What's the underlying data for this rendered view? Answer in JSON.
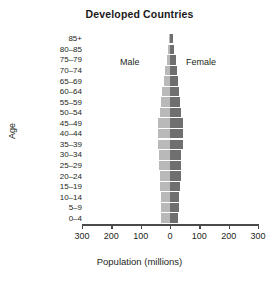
{
  "chart_data": {
    "type": "bar",
    "subtype": "population-pyramid",
    "title": "Developed Countries",
    "xlabel": "Population (millions)",
    "ylabel": "Age",
    "xlim": [
      -300,
      300
    ],
    "xticks": [
      -300,
      -200,
      -100,
      0,
      100,
      200,
      300
    ],
    "xticklabels": [
      "300",
      "200",
      "100",
      "0",
      "100",
      "200",
      "300"
    ],
    "grid": false,
    "legend_position": "inside-top",
    "categories": [
      "85+",
      "80–85",
      "75–79",
      "70–74",
      "65–69",
      "60–64",
      "55–59",
      "50–54",
      "45–49",
      "40–44",
      "35–39",
      "30–34",
      "25–29",
      "20–24",
      "15–19",
      "10–14",
      "5–9",
      "0–4"
    ],
    "series": [
      {
        "name": "Male",
        "color": "#b9b9b9",
        "direction": "left",
        "values": [
          4,
          7,
          11,
          16,
          22,
          26,
          30,
          34,
          40,
          41,
          40,
          37,
          36,
          35,
          34,
          32,
          30,
          29
        ]
      },
      {
        "name": "Female",
        "color": "#6f6f6f",
        "direction": "right",
        "values": [
          10,
          14,
          19,
          23,
          27,
          30,
          33,
          37,
          43,
          44,
          43,
          39,
          37,
          36,
          33,
          31,
          29,
          28
        ]
      }
    ],
    "annotations": [
      {
        "text": "Male",
        "side": "left"
      },
      {
        "text": "Female",
        "side": "right"
      }
    ]
  },
  "chart": {
    "title": "Developed Countries",
    "x_axis_title": "Population (millions)",
    "y_axis_title": "Age",
    "male_label": "Male",
    "female_label": "Female"
  }
}
